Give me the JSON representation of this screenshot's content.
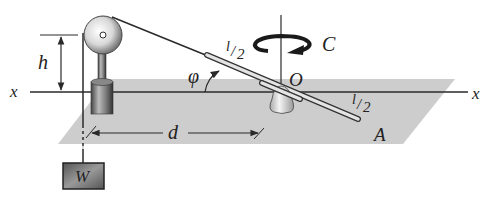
{
  "figure": {
    "labels": {
      "h": "h",
      "x_left": "x",
      "x_right": "x",
      "phi": "φ",
      "l_half_upper_num": "l",
      "l_half_upper_den": "2",
      "l_half_lower_num": "l",
      "l_half_lower_den": "2",
      "couple": "C",
      "origin": "O",
      "d": "d",
      "A": "A",
      "W": "W"
    },
    "colors": {
      "plane": "#c8c8c8",
      "line": "#2a2a2a",
      "weight_box": "#6e6e6e"
    }
  }
}
